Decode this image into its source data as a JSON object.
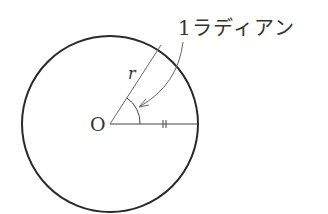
{
  "diagram": {
    "labels": {
      "radian": "1ラディアン",
      "radius": "r",
      "center": "O"
    },
    "colors": {
      "stroke": "#333333",
      "background": "#ffffff"
    }
  }
}
